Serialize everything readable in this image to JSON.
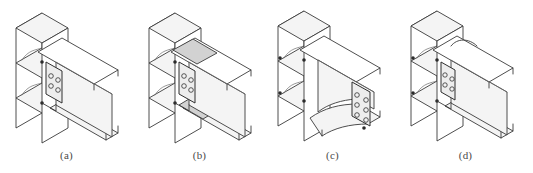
{
  "figure": {
    "panel_count": 4,
    "background_color": "#ffffff",
    "line_color": "#3a3a3a",
    "caption_color": "#4a4a4a"
  },
  "panels": [
    {
      "id": "a",
      "caption": "(a)",
      "detail_name": "welded-flange-bolted-web-connection",
      "column": "wide-flange-column",
      "beam": "wide-flange-beam",
      "shear_tab": "bolted-shear-tab",
      "bolt_rows": 2,
      "bolt_cols": 2,
      "bolt_count": 4,
      "continuity_plates": 3,
      "top_flange_reinforcement": "none",
      "bottom_flange_reinforcement": "none"
    },
    {
      "id": "b",
      "caption": "(b)",
      "detail_name": "cover-plate-reinforced-connection",
      "column": "wide-flange-column",
      "beam": "wide-flange-beam",
      "shear_tab": "bolted-shear-tab",
      "bolt_rows": 2,
      "bolt_cols": 2,
      "bolt_count": 4,
      "continuity_plates": 3,
      "top_flange_reinforcement": "top-cover-plate",
      "bottom_flange_reinforcement": "bottom-cover-plate"
    },
    {
      "id": "c",
      "caption": "(c)",
      "detail_name": "haunched-end-plate-connection",
      "column": "wide-flange-column",
      "beam": "tapered-haunch-beam",
      "shear_tab": "bolted-end-plate",
      "bolt_rows": 3,
      "bolt_cols": 2,
      "bolt_count": 6,
      "continuity_plates": 3,
      "top_flange_reinforcement": "tapered-haunch",
      "bottom_flange_reinforcement": "tapered-haunch"
    },
    {
      "id": "d",
      "caption": "(d)",
      "detail_name": "reduced-beam-section-connection",
      "column": "wide-flange-column",
      "beam": "reduced-beam-section",
      "shear_tab": "bolted-shear-tab",
      "bolt_rows": 2,
      "bolt_cols": 2,
      "bolt_count": 4,
      "continuity_plates": 3,
      "top_flange_reinforcement": "radius-cut-flange",
      "bottom_flange_reinforcement": "radius-cut-flange"
    }
  ]
}
